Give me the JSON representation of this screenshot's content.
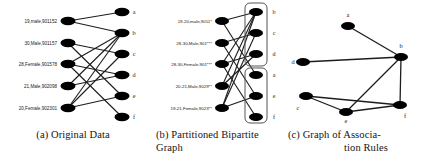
{
  "figure": {
    "panels": [
      {
        "id": "a",
        "caption": "(a) Original Data",
        "left_nodes": [
          {
            "label": "19,male,901152"
          },
          {
            "label": "30,Male,901157"
          },
          {
            "label": "28,Female,901578"
          },
          {
            "label": "21,Male,902098"
          },
          {
            "label": "20,Female,902301"
          }
        ],
        "right_nodes": [
          {
            "label": "a"
          },
          {
            "label": "b"
          },
          {
            "label": "c"
          },
          {
            "label": "d"
          },
          {
            "label": "e"
          },
          {
            "label": "f"
          }
        ],
        "edges": [
          {
            "from": 0,
            "to": "a"
          },
          {
            "from": 0,
            "to": "b"
          },
          {
            "from": 1,
            "to": "c"
          },
          {
            "from": 1,
            "to": "e"
          },
          {
            "from": 2,
            "to": "b"
          },
          {
            "from": 2,
            "to": "d"
          },
          {
            "from": 2,
            "to": "f"
          },
          {
            "from": 3,
            "to": "b"
          },
          {
            "from": 3,
            "to": "d"
          },
          {
            "from": 4,
            "to": "b"
          },
          {
            "from": 4,
            "to": "c"
          },
          {
            "from": 4,
            "to": "e"
          }
        ]
      },
      {
        "id": "b",
        "caption_line1": "(b)  Partitioned   Bipartite",
        "caption_line2": "Graph",
        "left_nodes": [
          {
            "label": "19-20,male,9011*"
          },
          {
            "label": "28-30,Male,901***"
          },
          {
            "label": "28-30,Female,901***"
          },
          {
            "label": "20-21,Male,9029**"
          },
          {
            "label": "19-21,Female,9023**"
          }
        ],
        "right_nodes": [
          {
            "label": "b"
          },
          {
            "label": "c"
          },
          {
            "label": "d"
          },
          {
            "label": "a"
          },
          {
            "label": "e"
          },
          {
            "label": "f"
          }
        ],
        "groups": [
          {
            "name": "partition-top",
            "members": [
              "b",
              "c",
              "d"
            ]
          },
          {
            "name": "partition-bottom",
            "members": [
              "a",
              "e",
              "f"
            ]
          }
        ],
        "edges": [
          {
            "from": 0,
            "to": "a"
          },
          {
            "from": 0,
            "to": "b"
          },
          {
            "from": 1,
            "to": "c"
          },
          {
            "from": 1,
            "to": "e"
          },
          {
            "from": 2,
            "to": "b"
          },
          {
            "from": 2,
            "to": "d"
          },
          {
            "from": 2,
            "to": "f"
          },
          {
            "from": 3,
            "to": "b"
          },
          {
            "from": 3,
            "to": "d"
          },
          {
            "from": 4,
            "to": "b"
          },
          {
            "from": 4,
            "to": "c"
          },
          {
            "from": 4,
            "to": "e"
          }
        ]
      },
      {
        "id": "c",
        "caption_line1": "(c) Graph of Associa-",
        "caption_line2": "tion Rules",
        "nodes": [
          {
            "label": "a",
            "x": 60,
            "y": 26
          },
          {
            "label": "b",
            "x": 113,
            "y": 57
          },
          {
            "label": "c",
            "x": 18,
            "y": 96
          },
          {
            "label": "d",
            "x": 15,
            "y": 62
          },
          {
            "label": "e",
            "x": 58,
            "y": 112
          },
          {
            "label": "f",
            "x": 112,
            "y": 105
          }
        ],
        "edges": [
          {
            "from": "a",
            "to": "b"
          },
          {
            "from": "d",
            "to": "b"
          },
          {
            "from": "b",
            "to": "e"
          },
          {
            "from": "b",
            "to": "f"
          },
          {
            "from": "c",
            "to": "e"
          },
          {
            "from": "c",
            "to": "f"
          },
          {
            "from": "e",
            "to": "f"
          }
        ]
      }
    ],
    "style": {
      "node_fill": "#000000",
      "edge_color": "#1c1c1c",
      "box_stroke": "#555555",
      "background": "#ffffff"
    }
  }
}
